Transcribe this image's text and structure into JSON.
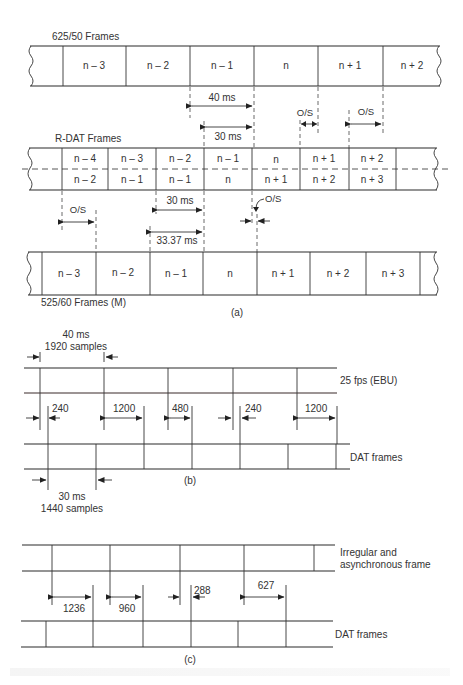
{
  "panel_a": {
    "label": "(a)",
    "row_625": {
      "title": "625/50 Frames",
      "cells": [
        "n – 3",
        "n – 2",
        "n – 1",
        "n",
        "n + 1",
        "n + 2"
      ]
    },
    "dim_40ms": "40 ms",
    "dim_30ms_top": "30 ms",
    "os_labels": [
      "O/S",
      "O/S",
      "O/S",
      "O/S"
    ],
    "row_rdat": {
      "title": "R-DAT Frames",
      "upper_cells": [
        "n – 4",
        "n – 3",
        "n – 2",
        "n – 1",
        "n",
        "n + 1",
        "n + 2"
      ],
      "lower_cells": [
        "n – 2",
        "n – 1",
        "n – 1",
        "n",
        "n + 1",
        "n + 2",
        "n + 3"
      ]
    },
    "dim_30ms_bottom": "30 ms",
    "dim_3337ms": "33.37 ms",
    "row_525": {
      "title": "525/60 Frames (M)",
      "cells": [
        "n – 3",
        "n – 2",
        "n – 1",
        "n",
        "n + 1",
        "n + 2",
        "n + 3"
      ]
    }
  },
  "panel_b": {
    "label": "(b)",
    "top_dim_line1": "40 ms",
    "top_dim_line2": "1920 samples",
    "top_row_label": "25 fps (EBU)",
    "offsets": [
      "240",
      "1200",
      "480",
      "240",
      "1200"
    ],
    "bottom_row_label": "DAT frames",
    "bottom_dim_line1": "30 ms",
    "bottom_dim_line2": "1440 samples"
  },
  "panel_c": {
    "label": "(c)",
    "top_row_label_line1": "Irregular and",
    "top_row_label_line2": "asynchronous frame",
    "offsets": [
      "1236",
      "960",
      "288",
      "627"
    ],
    "bottom_row_label": "DAT frames"
  }
}
